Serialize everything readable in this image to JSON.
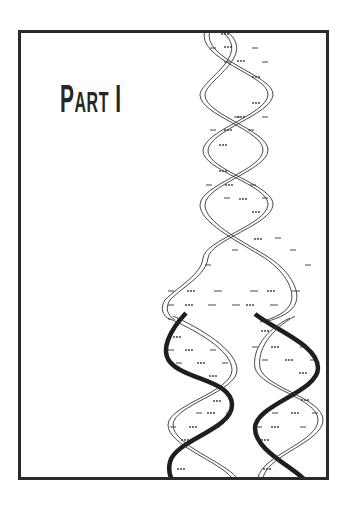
{
  "page": {
    "title_first_letter": "P",
    "title_rest": "ART",
    "title_numeral": "I",
    "title_full": "Part I"
  },
  "illustration": {
    "subject": "dna-replication-double-helix",
    "description": "Parent double helix unwinding into two daughter double helices",
    "colors": {
      "frame": "#2a2a2a",
      "strand_outline": "#333333",
      "new_strand": "#1e1e1e",
      "background": "#ffffff"
    }
  }
}
